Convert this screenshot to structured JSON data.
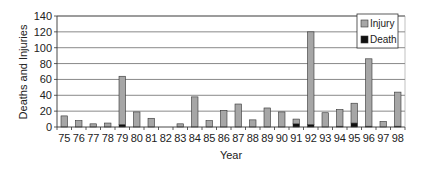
{
  "chart_data": {
    "type": "bar",
    "stacked": true,
    "title": "",
    "xlabel": "Year",
    "ylabel": "Deaths and Injuries",
    "ylim": [
      0,
      140
    ],
    "yticks": [
      0,
      20,
      40,
      60,
      80,
      100,
      120,
      140
    ],
    "grid": true,
    "legend_position": "top-right-inside",
    "categories": [
      "75",
      "76",
      "77",
      "78",
      "79",
      "80",
      "81",
      "82",
      "83",
      "84",
      "85",
      "86",
      "87",
      "88",
      "89",
      "90",
      "91",
      "92",
      "93",
      "94",
      "95",
      "96",
      "97",
      "98"
    ],
    "series": [
      {
        "name": "Injury",
        "color": "#a6a6a6",
        "values": [
          14,
          8,
          4,
          5,
          61,
          19,
          11,
          0,
          4,
          38,
          8,
          21,
          29,
          9,
          24,
          19,
          6,
          117,
          18,
          21,
          25,
          85,
          7,
          43
        ]
      },
      {
        "name": "Death",
        "color": "#111111",
        "values": [
          0,
          0,
          0,
          0,
          3,
          0,
          0,
          0,
          0,
          0,
          0,
          0,
          0,
          0,
          0,
          0,
          4,
          3,
          0,
          1,
          5,
          1,
          0,
          1
        ]
      }
    ]
  }
}
